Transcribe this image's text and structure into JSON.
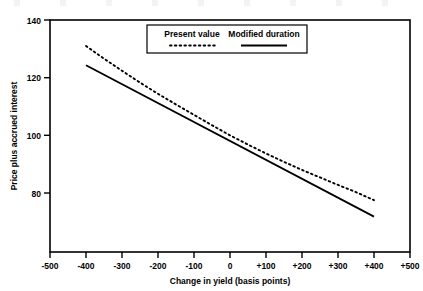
{
  "chart_data": {
    "type": "line",
    "title": "",
    "xlabel": "Change in yield (basis points)",
    "ylabel": "Price plus accrued interest",
    "xlim": [
      -500,
      500
    ],
    "ylim": [
      68,
      140
    ],
    "xticks": [
      "-500",
      "-400",
      "-300",
      "-200",
      "-100",
      "0",
      "+100",
      "+200",
      "+300",
      "+400",
      "+500"
    ],
    "xtick_values": [
      -500,
      -400,
      -300,
      -200,
      -100,
      0,
      100,
      200,
      300,
      400,
      500
    ],
    "yticks": [
      "140",
      "120",
      "100",
      "80"
    ],
    "ytick_values": [
      140,
      120,
      100,
      80
    ],
    "grid": false,
    "legend_position": "top-center",
    "series": [
      {
        "name": "Present value",
        "style": "dotted",
        "x": [
          -400,
          -350,
          -300,
          -250,
          -200,
          -150,
          -100,
          -50,
          0,
          50,
          100,
          150,
          200,
          250,
          300,
          350,
          400
        ],
        "values": [
          131.0,
          126.6,
          122.4,
          118.3,
          114.4,
          110.7,
          107.1,
          103.5,
          100.0,
          96.8,
          93.7,
          90.8,
          88.0,
          85.4,
          82.8,
          80.3,
          77.5
        ]
      },
      {
        "name": "Modified duration",
        "style": "solid",
        "x": [
          -400,
          400
        ],
        "values": [
          124.3,
          71.8
        ]
      }
    ]
  },
  "legend": {
    "items": [
      {
        "label": "Present value",
        "style": "dotted"
      },
      {
        "label": "Modified duration",
        "style": "solid"
      }
    ]
  }
}
